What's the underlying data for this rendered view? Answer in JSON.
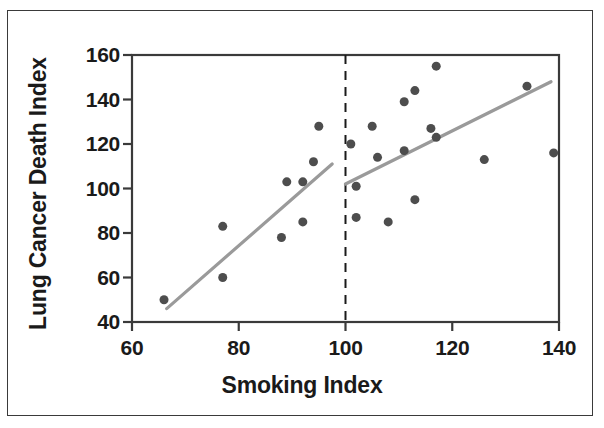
{
  "chart_data": {
    "type": "scatter",
    "title": "",
    "xlabel": "Smoking Index",
    "ylabel": "Lung Cancer Death Index",
    "xlim": [
      60,
      140
    ],
    "ylim": [
      40,
      160
    ],
    "xticks": [
      60,
      80,
      100,
      120,
      140
    ],
    "yticks": [
      40,
      60,
      80,
      100,
      120,
      140,
      160
    ],
    "xtick_labels": [
      "60",
      "80",
      "100",
      "120",
      "140"
    ],
    "ytick_labels": [
      "40",
      "60",
      "80",
      "100",
      "120",
      "140",
      "160"
    ],
    "grid": false,
    "legend": null,
    "marker_color": "#4d4d4d",
    "marker_size": 9,
    "line_color": "#9a9a9a",
    "axis_color": "#3a3a3a",
    "points": [
      {
        "x": 66,
        "y": 50
      },
      {
        "x": 77,
        "y": 60
      },
      {
        "x": 77,
        "y": 83
      },
      {
        "x": 88,
        "y": 78
      },
      {
        "x": 89,
        "y": 103
      },
      {
        "x": 92,
        "y": 103
      },
      {
        "x": 92,
        "y": 85
      },
      {
        "x": 94,
        "y": 112
      },
      {
        "x": 95,
        "y": 128
      },
      {
        "x": 101,
        "y": 120
      },
      {
        "x": 102,
        "y": 101
      },
      {
        "x": 102,
        "y": 87
      },
      {
        "x": 105,
        "y": 128
      },
      {
        "x": 106,
        "y": 114
      },
      {
        "x": 108,
        "y": 85
      },
      {
        "x": 111,
        "y": 139
      },
      {
        "x": 111,
        "y": 117
      },
      {
        "x": 113,
        "y": 144
      },
      {
        "x": 113,
        "y": 95
      },
      {
        "x": 116,
        "y": 127
      },
      {
        "x": 117,
        "y": 155
      },
      {
        "x": 117,
        "y": 123
      },
      {
        "x": 126,
        "y": 113
      },
      {
        "x": 134,
        "y": 146
      },
      {
        "x": 139,
        "y": 116
      }
    ],
    "fit_lines": [
      {
        "name": "left-segment",
        "x1": 66.5,
        "y1": 46,
        "x2": 97.5,
        "y2": 111
      },
      {
        "name": "right-segment",
        "x1": 100,
        "y1": 102,
        "x2": 138.5,
        "y2": 148
      }
    ],
    "reference_line": {
      "name": "vertical-dashed-at-100",
      "x": 100,
      "style": "dashed",
      "color": "#1a1a1a"
    },
    "annotations": []
  }
}
